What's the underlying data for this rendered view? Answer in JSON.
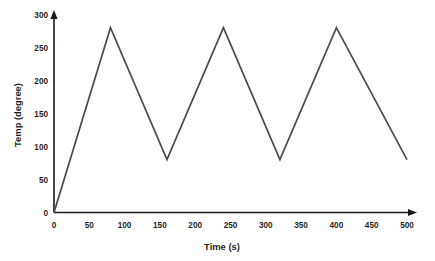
{
  "chart_data": {
    "type": "line",
    "title": "",
    "xlabel": "Time (s)",
    "ylabel": "Temp (degree)",
    "xlim": [
      0,
      500
    ],
    "ylim": [
      0,
      300
    ],
    "xticks": [
      0,
      50,
      100,
      150,
      200,
      250,
      300,
      350,
      400,
      450,
      500
    ],
    "yticks": [
      0,
      50,
      100,
      150,
      200,
      250,
      300
    ],
    "grid": false,
    "legend": "none",
    "line_color": "#4a4a4a",
    "axis_color": "#1a1a1a",
    "background_color": "#ffffff",
    "series": [
      {
        "name": "Temperature profile",
        "x": [
          0,
          80,
          160,
          240,
          320,
          400,
          500
        ],
        "values": [
          0,
          280,
          80,
          280,
          80,
          280,
          80
        ]
      }
    ],
    "annotations": []
  },
  "axes": {
    "x_title": "Time (s)",
    "y_title": "Temp (degree)",
    "x_tick_labels": [
      "0",
      "50",
      "100",
      "150",
      "200",
      "250",
      "300",
      "350",
      "400",
      "450",
      "500"
    ],
    "y_tick_labels": [
      "0",
      "50",
      "100",
      "150",
      "200",
      "250",
      "300"
    ]
  }
}
